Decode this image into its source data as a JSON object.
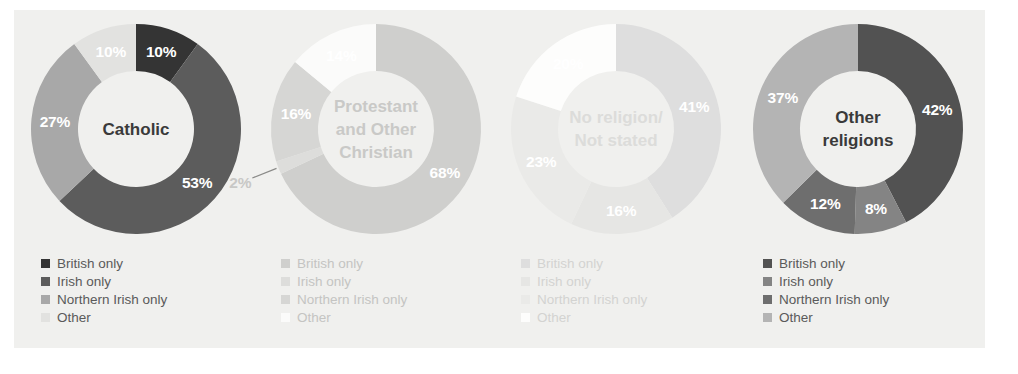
{
  "figure": {
    "background": "#f0f0ee",
    "panel_color": "#f0f0ee",
    "page_color": "#ffffff"
  },
  "legend_labels": [
    "British only",
    "Irish only",
    "Northern Irish only",
    "Other"
  ],
  "chart_data": {
    "type": "pie",
    "title": "",
    "subtitle": "",
    "xlabel": "",
    "ylabel": "",
    "legend_position": "below-each-chart",
    "grid": false,
    "categories": [
      "British only",
      "Irish only",
      "Northern Irish only",
      "Other"
    ],
    "note": "Four donut (ring) charts; each ring starts at 12 o'clock and runs clockwise through the four categories.",
    "charts": [
      {
        "id": "catholic",
        "center_label": "Catholic",
        "center_label_line1": "Catholic",
        "center_label_line2": "",
        "center_text_color": "#3a3a3a",
        "values": [
          10,
          53,
          27,
          10
        ],
        "value_labels": [
          "10%",
          "53%",
          "27%",
          "10%"
        ],
        "colors": [
          "#343434",
          "#5c5c5c",
          "#a8a8a8",
          "#e2e2e0"
        ],
        "label_colors": [
          "#ffffff",
          "#ffffff",
          "#ffffff",
          "#ffffff"
        ],
        "legend_text_color": "#5a5a5a",
        "leader_for": null
      },
      {
        "id": "protestant-and-other-christian",
        "center_label": "Protestant and Other Christian",
        "center_label_line1": "Protestant",
        "center_label_line2": "and Other",
        "center_label_line3": "Christian",
        "center_text_color": "#c9c9c7",
        "values": [
          68,
          2,
          16,
          14
        ],
        "value_labels": [
          "68%",
          "2%",
          "16%",
          "14%"
        ],
        "colors": [
          "#cfcfcd",
          "#dddddb",
          "#d6d6d4",
          "#fbfbfa"
        ],
        "label_colors": [
          "#ffffff",
          "#c8c8c6",
          "#ffffff",
          "#ffffff"
        ],
        "legend_text_color": "#c4c4c2",
        "leader_for": "2%"
      },
      {
        "id": "no-religion-not-stated",
        "center_label": "No religion/ Not stated",
        "center_label_line1": "No religion/",
        "center_label_line2": "Not stated",
        "center_text_color": "#dcdcda",
        "values": [
          41,
          16,
          23,
          20
        ],
        "value_labels": [
          "41%",
          "16%",
          "23%",
          "20%"
        ],
        "colors": [
          "#dedede",
          "#e6e6e4",
          "#eaeae8",
          "#fdfdfc"
        ],
        "label_colors": [
          "#ffffff",
          "#ffffff",
          "#ffffff",
          "#ffffff"
        ],
        "legend_text_color": "#d3d3d1",
        "leader_for": null
      },
      {
        "id": "other-religions",
        "center_label": "Other religions",
        "center_label_line1": "Other",
        "center_label_line2": "religions",
        "center_text_color": "#3a3a3a",
        "values": [
          42,
          8,
          12,
          37
        ],
        "value_labels": [
          "42%",
          "8%",
          "12%",
          "37%"
        ],
        "colors": [
          "#525252",
          "#848484",
          "#6e6e6e",
          "#b4b4b4"
        ],
        "label_colors": [
          "#ffffff",
          "#ffffff",
          "#ffffff",
          "#ffffff"
        ],
        "legend_text_color": "#5a5a5a",
        "leader_for": null
      }
    ]
  }
}
